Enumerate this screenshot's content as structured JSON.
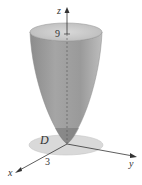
{
  "figure": {
    "labels": {
      "z_axis": "z",
      "x_axis": "x",
      "y_axis": "y",
      "region": "D",
      "height_tick": "9",
      "radius_tick": "3"
    },
    "colors": {
      "surface": "#8a8a8a",
      "surface_light": "#b4b4b4",
      "rim": "#c8c8c8",
      "disk": "#d6d6d6",
      "axis": "#333333"
    }
  }
}
